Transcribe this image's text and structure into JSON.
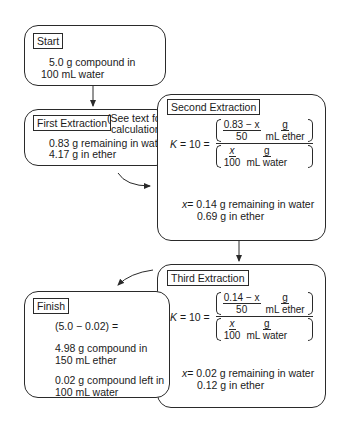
{
  "start": {
    "label": "Start",
    "line1": "5.0 g compound in",
    "line2": "100 mL water"
  },
  "first": {
    "label": "First Extraction",
    "note_line1": "(See text for",
    "note_line2": "calculation.)",
    "line1": "0.83 g remaining in water",
    "line2": "4.17 g in ether"
  },
  "second": {
    "label": "Second Extraction",
    "k_label": "K",
    "k_eq": "= 10 =",
    "top_frac_num": "0.83 − x",
    "top_frac_den": "50",
    "top_unit_num": "g",
    "top_unit_den": "mL ether",
    "bot_frac_num": "x",
    "bot_frac_den": "100",
    "bot_unit_num": "g",
    "bot_unit_den": "mL water",
    "result_var": "x",
    "result_line1": "= 0.14 g remaining in water",
    "result_line2": "0.69 g in ether"
  },
  "third": {
    "label": "Third Extraction",
    "k_label": "K",
    "k_eq": "= 10 =",
    "top_frac_num": "0.14 − x",
    "top_frac_den": "50",
    "top_unit_num": "g",
    "top_unit_den": "mL ether",
    "bot_frac_num": "x",
    "bot_frac_den": "100",
    "bot_unit_num": "g",
    "bot_unit_den": "mL water",
    "result_var": "x",
    "result_line1": "= 0.02 g remaining in water",
    "result_line2": "0.12 g in ether"
  },
  "finish": {
    "label": "Finish",
    "line1": "(5.0 − 0.02) =",
    "line2": "4.98 g compound in",
    "line3": "150 mL ether",
    "line4": "0.02 g compound left in",
    "line5": "100 mL water"
  },
  "colors": {
    "line": "#2a2a2a",
    "background": "#ffffff",
    "text": "#1a1a1a"
  }
}
